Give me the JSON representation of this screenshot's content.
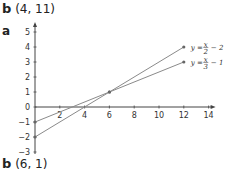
{
  "answers": {
    "top": {
      "letter": "b",
      "value": "(4, 11)"
    },
    "part_a": "a",
    "bottom": {
      "letter": "b",
      "value": "(6, 1)"
    }
  },
  "chart_data": {
    "type": "line",
    "title": "",
    "xlabel": "",
    "ylabel": "",
    "xlim": [
      0,
      14
    ],
    "ylim": [
      -3,
      5
    ],
    "x_ticks": [
      2,
      4,
      6,
      8,
      10,
      12,
      14
    ],
    "y_ticks": [
      5,
      4,
      3,
      2,
      1,
      0,
      -1,
      -2,
      -3
    ],
    "grid": false,
    "series": [
      {
        "name": "y = x/2 − 2",
        "x": [
          0,
          6,
          12
        ],
        "y": [
          -2,
          1,
          4
        ]
      },
      {
        "name": "y = x/3 − 1",
        "x": [
          0,
          6,
          12
        ],
        "y": [
          -1,
          1,
          3
        ]
      }
    ],
    "annotations": [
      {
        "text": "y = x/2 − 2",
        "at": [
          12,
          4
        ]
      },
      {
        "text": "y = x/3 − 1",
        "at": [
          12,
          3
        ]
      }
    ],
    "intersection": [
      6,
      1
    ]
  },
  "colors": {
    "line": "#8a8a8a",
    "axis": "#444444",
    "point": "#666666"
  }
}
